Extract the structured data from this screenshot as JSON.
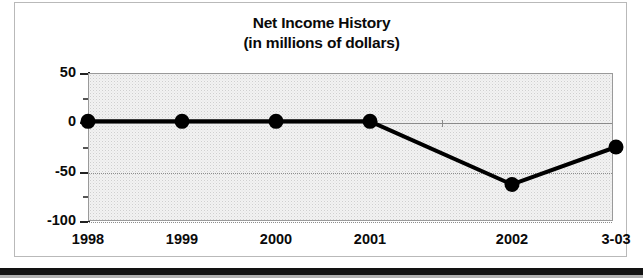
{
  "chart_data": {
    "type": "line",
    "title": "Net Income History",
    "subtitle": "(in millions of dollars)",
    "xlabel": "",
    "ylabel": "",
    "categories": [
      "1998",
      "1999",
      "2000",
      "2001",
      "2002",
      "3-03"
    ],
    "values": [
      1,
      1,
      1,
      1,
      -63,
      -25
    ],
    "ylim": [
      -100,
      50
    ],
    "ytick_labels": [
      "50",
      "0",
      "-50",
      "-100"
    ],
    "ytick_values": [
      50,
      0,
      -50,
      -100
    ],
    "yminor_interval": 25,
    "grid": "horizontal-dotted",
    "legend": "none",
    "series": [
      {
        "name": "Net Income",
        "values": [
          1,
          1,
          1,
          1,
          -63,
          -25
        ],
        "line_color": "#000000",
        "marker": "circle",
        "marker_color": "#000000"
      }
    ],
    "plot_background": "#f2f2f2",
    "axis_color": "#222222",
    "gridline_color": "#8d8d8d"
  }
}
